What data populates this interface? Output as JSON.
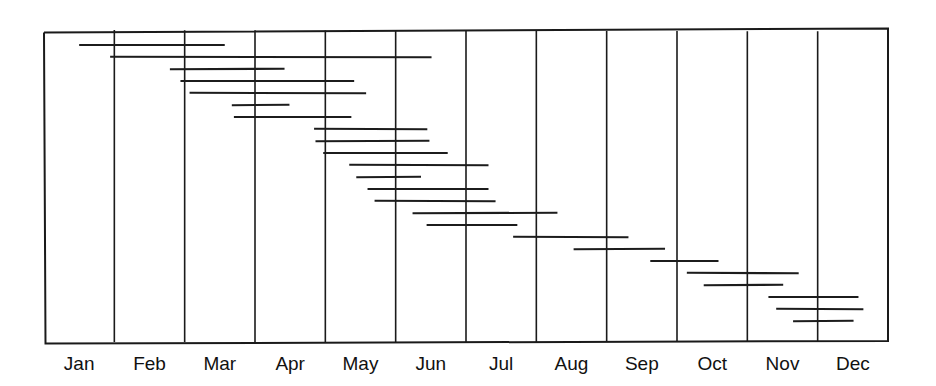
{
  "figure": {
    "title": "",
    "background_color": "#ffffff",
    "line_color": "#1a1a1a",
    "bar_color": "#1c1c1c"
  },
  "chart_data": {
    "type": "bar",
    "orientation": "horizontal-gantt",
    "title": "",
    "xlabel": "",
    "ylabel": "",
    "grid": true,
    "grid_axis": "x",
    "legend": "none",
    "categories": [
      "Jan",
      "Feb",
      "Mar",
      "Apr",
      "May",
      "Jun",
      "Jul",
      "Aug",
      "Sep",
      "Oct",
      "Nov",
      "Dec"
    ],
    "tick_labels": [
      "Jan",
      "Feb",
      "Mar",
      "Apr",
      "May",
      "Jun",
      "Jul",
      "Aug",
      "Sep",
      "Oct",
      "Nov",
      "Dec"
    ],
    "xlim": [
      0,
      12
    ],
    "xlim_units": "months",
    "ylim": [
      0,
      24
    ],
    "ylabel_ticks": [],
    "n_bars": 24,
    "note": "Each horizontal line is one task/interval spanning a start month to an end month; rows are stacked top to bottom in staggered (cascading) order.",
    "bars": [
      {
        "index": 1,
        "row": 1,
        "start_month": 0.5,
        "end_month": 2.57,
        "start_label": "mid-Jan",
        "end_label": "mid-Mar",
        "duration_months": 2.07
      },
      {
        "index": 2,
        "row": 2,
        "start_month": 0.94,
        "end_month": 5.51,
        "start_label": "early-Feb",
        "end_label": "mid-Jun",
        "duration_months": 4.57
      },
      {
        "index": 3,
        "row": 3,
        "start_month": 1.79,
        "end_month": 3.42,
        "start_label": "late-Feb",
        "end_label": "mid-Apr",
        "duration_months": 1.63
      },
      {
        "index": 4,
        "row": 4,
        "start_month": 1.94,
        "end_month": 4.41,
        "start_label": "early-Mar",
        "end_label": "mid-May",
        "duration_months": 2.47
      },
      {
        "index": 5,
        "row": 5,
        "start_month": 2.07,
        "end_month": 4.58,
        "start_label": "early-Mar",
        "end_label": "mid-May",
        "duration_months": 2.51
      },
      {
        "index": 6,
        "row": 6,
        "start_month": 2.67,
        "end_month": 3.49,
        "start_label": "mid-Mar",
        "end_label": "mid-Apr",
        "duration_months": 0.82
      },
      {
        "index": 7,
        "row": 7,
        "start_month": 2.7,
        "end_month": 4.37,
        "start_label": "mid-Mar",
        "end_label": "mid-May",
        "duration_months": 1.67
      },
      {
        "index": 8,
        "row": 8,
        "start_month": 3.84,
        "end_month": 5.45,
        "start_label": "late-Apr",
        "end_label": "mid-Jun",
        "duration_months": 1.61
      },
      {
        "index": 9,
        "row": 9,
        "start_month": 3.86,
        "end_month": 5.48,
        "start_label": "late-Apr",
        "end_label": "mid-Jun",
        "duration_months": 1.62
      },
      {
        "index": 10,
        "row": 10,
        "start_month": 3.97,
        "end_month": 5.74,
        "start_label": "late-Apr",
        "end_label": "late-Jun",
        "duration_months": 1.77
      },
      {
        "index": 11,
        "row": 11,
        "start_month": 4.34,
        "end_month": 6.32,
        "start_label": "mid-May",
        "end_label": "mid-Jul",
        "duration_months": 1.98
      },
      {
        "index": 12,
        "row": 12,
        "start_month": 4.44,
        "end_month": 5.36,
        "start_label": "mid-May",
        "end_label": "mid-Jun",
        "duration_months": 0.92
      },
      {
        "index": 13,
        "row": 13,
        "start_month": 4.6,
        "end_month": 6.32,
        "start_label": "mid-May",
        "end_label": "mid-Jul",
        "duration_months": 1.72
      },
      {
        "index": 14,
        "row": 14,
        "start_month": 4.7,
        "end_month": 6.42,
        "start_label": "mid-May",
        "end_label": "mid-Jul",
        "duration_months": 1.72
      },
      {
        "index": 15,
        "row": 15,
        "start_month": 5.24,
        "end_month": 7.3,
        "start_label": "early-Jun",
        "end_label": "late-Jul",
        "duration_months": 2.06
      },
      {
        "index": 16,
        "row": 16,
        "start_month": 5.44,
        "end_month": 6.73,
        "start_label": "mid-Jun",
        "end_label": "mid-Jul",
        "duration_months": 1.29
      },
      {
        "index": 17,
        "row": 17,
        "start_month": 6.67,
        "end_month": 8.31,
        "start_label": "mid-Jul",
        "end_label": "late-Aug",
        "duration_months": 1.64
      },
      {
        "index": 18,
        "row": 18,
        "start_month": 7.53,
        "end_month": 8.83,
        "start_label": "mid-Aug",
        "end_label": "late-Aug",
        "duration_months": 1.3
      },
      {
        "index": 19,
        "row": 19,
        "start_month": 8.62,
        "end_month": 9.59,
        "start_label": "mid-Sep",
        "end_label": "mid-Oct",
        "duration_months": 0.97
      },
      {
        "index": 20,
        "row": 20,
        "start_month": 9.14,
        "end_month": 10.73,
        "start_label": "early-Oct",
        "end_label": "late-Oct",
        "duration_months": 1.59
      },
      {
        "index": 21,
        "row": 21,
        "start_month": 9.38,
        "end_month": 10.51,
        "start_label": "mid-Oct",
        "end_label": "mid-Nov",
        "duration_months": 1.13
      },
      {
        "index": 22,
        "row": 22,
        "start_month": 10.3,
        "end_month": 11.58,
        "start_label": "mid-Nov",
        "end_label": "mid-Dec",
        "duration_months": 1.28
      },
      {
        "index": 23,
        "row": 23,
        "start_month": 10.41,
        "end_month": 11.65,
        "start_label": "mid-Nov",
        "end_label": "mid-Dec",
        "duration_months": 1.24
      },
      {
        "index": 24,
        "row": 24,
        "start_month": 10.65,
        "end_month": 11.51,
        "start_label": "late-Nov",
        "end_label": "mid-Dec",
        "duration_months": 0.86
      }
    ]
  },
  "geometry": {
    "plot_left": 44,
    "plot_right": 888,
    "plot_top": 30,
    "plot_bottom": 342,
    "month_width": 70.33,
    "row_first_y": 45,
    "row_spacing": 12.0,
    "label_baseline_y": 370,
    "bar_stroke_width": 2.1,
    "grid_stroke_width": 1.6,
    "frame_stroke_width": 2.0
  }
}
